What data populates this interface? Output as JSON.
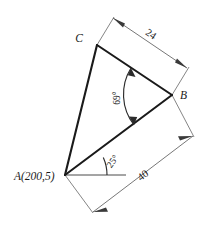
{
  "figure": {
    "type": "geometry-diagram",
    "background_color": "#ffffff",
    "line_color": "#1a1a1a",
    "dimension_line_color": "#5f5f5f",
    "vertices": [
      {
        "id": "A",
        "label": "A(200,5)",
        "x": 65,
        "y": 175
      },
      {
        "id": "B",
        "label": "B",
        "x": 172,
        "y": 95
      },
      {
        "id": "C",
        "label": "C",
        "x": 97,
        "y": 45
      }
    ],
    "dimensions": [
      {
        "id": "CB",
        "label": "24",
        "from": "C",
        "to": "B"
      },
      {
        "id": "AB",
        "label": "40",
        "from": "A",
        "to": "B"
      }
    ],
    "angles": [
      {
        "id": "at-B",
        "label": "69°",
        "vertex": "B"
      },
      {
        "id": "at-A",
        "label": "25°",
        "vertex": "A"
      }
    ]
  }
}
